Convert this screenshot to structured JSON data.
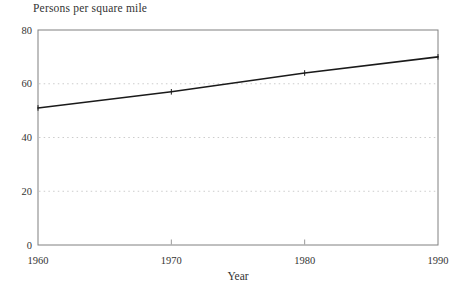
{
  "page": {
    "background_color": "#ffffff",
    "text_color": "#333333"
  },
  "chart_data": {
    "type": "line",
    "title": "Persons per square mile",
    "xlabel": "Year",
    "ylabel": "",
    "categories": [
      "1960",
      "1970",
      "1980",
      "1990"
    ],
    "values": [
      51,
      57,
      64,
      70
    ],
    "ylim": [
      0,
      80
    ],
    "yticks": [
      0,
      20,
      40,
      60,
      80
    ],
    "gridline_values": [
      20,
      40,
      60
    ],
    "grid_style": "dotted",
    "grid_on": true,
    "legend_position": "none",
    "marker": "plus",
    "line_color": "#1a1a1a",
    "grid_color": "#cccccc",
    "axis_color": "#808080",
    "tick_color": "#999999",
    "text_color": "#333333"
  }
}
